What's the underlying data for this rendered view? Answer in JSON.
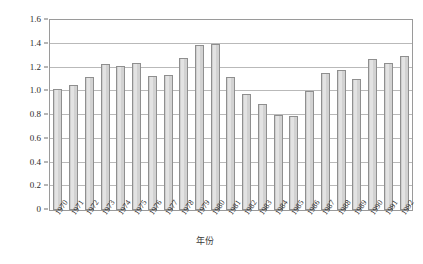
{
  "chart_data": {
    "type": "bar",
    "title": "",
    "xlabel": "年份",
    "ylabel": "1欧元可兑换的美元/美元",
    "ylim": [
      0,
      1.6
    ],
    "yticks": [
      "0",
      "0.2",
      "0.4",
      "0.6",
      "0.8",
      "1.0",
      "1.2",
      "1.4",
      "1.6"
    ],
    "ytick_values": [
      0,
      0.2,
      0.4,
      0.6,
      0.8,
      1.0,
      1.2,
      1.4,
      1.6
    ],
    "grid": "horizontal",
    "legend": "none",
    "categories": [
      "1970",
      "1971",
      "1972",
      "1973",
      "1974",
      "1975",
      "1976",
      "1977",
      "1978",
      "1979",
      "1980",
      "1981",
      "1982",
      "1983",
      "1984",
      "1985",
      "1986",
      "1987",
      "1988",
      "1989",
      "1990",
      "1991",
      "1992"
    ],
    "values": [
      1.02,
      1.05,
      1.12,
      1.23,
      1.21,
      1.24,
      1.13,
      1.14,
      1.28,
      1.39,
      1.4,
      1.12,
      0.98,
      0.89,
      0.8,
      0.79,
      1.0,
      1.15,
      1.18,
      1.1,
      1.27,
      1.24,
      1.3
    ],
    "bar_color": "#d9d9d9",
    "bar_edge_color": "#8f8f8f",
    "grid_color": "#b9b9b9",
    "frame_color": "#9a9a9a"
  }
}
